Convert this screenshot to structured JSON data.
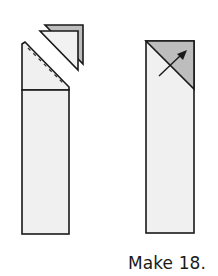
{
  "caption": {
    "text": "Make 18."
  },
  "colors": {
    "fabric_light": "#f0f0f0",
    "fabric_shaded": "#bdbdbd",
    "outline": "#1a1a1a",
    "background": "#ffffff"
  },
  "figures": [
    {
      "id": "step-left",
      "description": "Rectangle with top-left corner trimmed along a dashed sewing line; two stacked triangles set aside",
      "elements": [
        "trimmed-rectangle",
        "dashed-seam-line",
        "horizontal-seam",
        "trimmed-triangle-pair"
      ]
    },
    {
      "id": "step-right",
      "description": "Rectangle with shaded corner triangle pressed open, arrow indicating press direction",
      "elements": [
        "rectangle",
        "diagonal-seam",
        "shaded-corner",
        "press-arrow"
      ]
    }
  ]
}
